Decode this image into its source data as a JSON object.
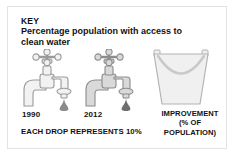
{
  "panel": {
    "key_word": "KEY",
    "subtitle": "Percentage population with access to clean water",
    "border_color": "#e3e3e3",
    "background_color": "#ffffff"
  },
  "graphics": {
    "taps": [
      {
        "icon": "faucet-icon",
        "year_label": "1990",
        "drop_icon": "water-drop-icon",
        "body_color": "#f2f2f2",
        "outline_color": "#9a9a9a",
        "drop_color": "#8a8a8a"
      },
      {
        "icon": "faucet-icon",
        "year_label": "2012",
        "drop_icon": "water-drop-icon",
        "body_color": "#d9d9d9",
        "outline_color": "#8c8c8c",
        "drop_color": "#6e6e6e"
      }
    ],
    "bucket": {
      "icon": "bucket-icon",
      "body_color": "#f0f0f0",
      "outline_color": "#b4b4b4",
      "handle_color": "#c9c9c9"
    }
  },
  "captions": {
    "drop_key": "EACH DROP REPRESENTS 10%",
    "improvement_lines": [
      "IMPROVEMENT",
      "(% OF",
      "POPULATION)"
    ]
  }
}
